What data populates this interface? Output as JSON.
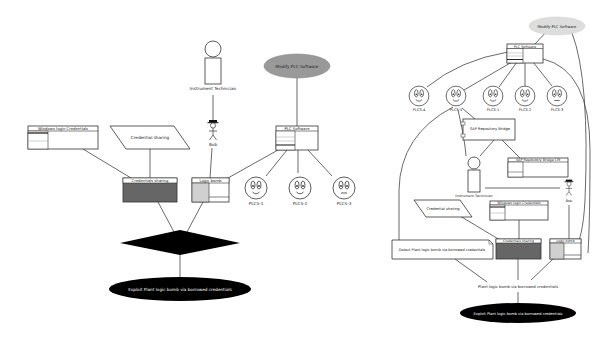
{
  "left_diagram": {
    "goal": {
      "label": "Exploit Plant logic bomb via borrowed credentials",
      "fill": "#000000"
    },
    "and_gate": {
      "shape": "diamond",
      "fill": "#000000"
    },
    "nodes": {
      "windows_login_credentials": {
        "label": "Windows login Credentials"
      },
      "credential_sharing_action": {
        "label": "Credential sharing"
      },
      "credentials_sharing_vuln": {
        "label": "Credentials sharing",
        "fill": "#666666"
      },
      "logic_bomb": {
        "label": "Logic bomb",
        "accent": "#d0d0d0"
      },
      "plc_software": {
        "label": "PLC Software"
      },
      "modify_plc_software": {
        "label": "Modify PLC Software",
        "fill": "#999999"
      },
      "instrument_technician": {
        "label": "Instrument Technician"
      },
      "bob": {
        "label": "Bob"
      },
      "plcs": [
        {
          "label": "PLCS-1"
        },
        {
          "label": "PLCS-2"
        },
        {
          "label": "PLCS-3"
        }
      ]
    }
  },
  "right_diagram": {
    "goal": {
      "label": "Exploit Plant logic bomb via borrowed credentials",
      "fill": "#000000"
    },
    "intermediate": {
      "label": "Plant logic bomb via borrowed credentials"
    },
    "nodes": {
      "modify_plc_software": {
        "label": "Modify PLC Software",
        "fill": "#dddddd"
      },
      "plc_software": {
        "label": "PLC Software"
      },
      "plcs": [
        {
          "label": "PLCS-4"
        },
        {
          "label": "PLCS-5"
        },
        {
          "label": "PLCS-1"
        },
        {
          "label": "PLCS-2"
        },
        {
          "label": "PLCS-3"
        }
      ],
      "sap_repository_bridge": {
        "label": "SAP Repository Bridge"
      },
      "sap_repository_bridge_cm": {
        "label": "SAP Repository Bridge CM"
      },
      "instrument_technician": {
        "label": "Instrument Technician"
      },
      "bob": {
        "label": "Bob"
      },
      "credential_sharing_action": {
        "label": "Credential sharing"
      },
      "windows_login_credentials": {
        "label": "Windows login Credentials"
      },
      "detect_note": {
        "label": "Detect Plant logic bomb via borrowed credentials"
      },
      "credentials_sharing_vuln": {
        "label": "Credentials sharing",
        "fill": "#666666"
      },
      "logic_bomb": {
        "label": "Logic bomb",
        "accent": "#d0d0d0"
      }
    }
  }
}
